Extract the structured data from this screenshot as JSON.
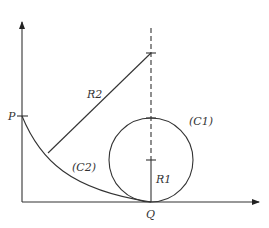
{
  "diagram": {
    "labels": {
      "P": "P",
      "Q": "Q",
      "R1": "R1",
      "R2": "R2",
      "C1": "(C1)",
      "C2": "(C2)"
    },
    "colors": {
      "stroke": "#333333",
      "background": "#ffffff"
    },
    "elements": {
      "y_axis": {
        "x": 22,
        "y_top": 20,
        "y_bottom": 202
      },
      "x_axis": {
        "y": 202,
        "x_left": 22,
        "x_right": 261
      },
      "circle_C1": {
        "cx": 151,
        "cy": 160,
        "r": 42
      },
      "dashed_vertical": {
        "x": 151,
        "y_top": 28,
        "y_bottom": 160
      },
      "point_P": {
        "x": 22,
        "y": 116
      },
      "point_Q": {
        "x": 151,
        "y": 202
      },
      "R2_end": {
        "x": 151,
        "y": 53
      },
      "R2_start_on_C2": {
        "x": 48,
        "y": 153
      }
    }
  }
}
